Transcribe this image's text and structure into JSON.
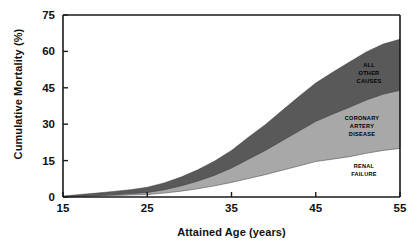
{
  "chart_data": {
    "type": "area",
    "title": "",
    "xlabel": "Attained Age (years)",
    "ylabel": "Cumulative Mortality (%)",
    "xlim": [
      15,
      55
    ],
    "ylim": [
      0,
      75
    ],
    "xticks": [
      "15",
      "25",
      "35",
      "45",
      "55"
    ],
    "xtick_values": [
      15,
      25,
      35,
      45,
      55
    ],
    "yticks": [
      "0",
      "15",
      "30",
      "45",
      "60",
      "75"
    ],
    "ytick_values": [
      0,
      15,
      30,
      45,
      60,
      75
    ],
    "grid": false,
    "legend_position": "inline-band-labels",
    "stacked": true,
    "x": [
      15,
      17,
      19,
      21,
      23,
      25,
      27,
      29,
      31,
      33,
      35,
      37,
      39,
      41,
      43,
      45,
      47,
      49,
      51,
      53,
      55
    ],
    "series": [
      {
        "name": "RENAL FAILURE",
        "color": "#ffffff",
        "order": 1,
        "values": [
          0.0,
          0.2,
          0.4,
          0.6,
          0.8,
          1.0,
          1.6,
          2.4,
          3.4,
          4.6,
          6.0,
          7.6,
          9.2,
          11.0,
          12.8,
          14.6,
          15.6,
          16.6,
          18.0,
          19.2,
          20.0
        ]
      },
      {
        "name": "CORONARY ARTERY DISEASE",
        "color": "#a8a8a8",
        "order": 2,
        "values": [
          0.0,
          0.1,
          0.2,
          0.4,
          0.6,
          0.9,
          1.4,
          2.2,
          3.2,
          4.4,
          6.0,
          8.0,
          10.0,
          12.2,
          14.4,
          16.6,
          18.6,
          20.4,
          22.0,
          23.2,
          24.0
        ]
      },
      {
        "name": "ALL OTHER CAUSES",
        "color": "#595959",
        "order": 3,
        "values": [
          0.4,
          0.7,
          1.0,
          1.3,
          1.6,
          2.1,
          2.8,
          3.6,
          4.6,
          5.8,
          7.2,
          9.0,
          10.6,
          12.4,
          14.2,
          15.8,
          17.2,
          18.6,
          19.8,
          20.6,
          21.0
        ]
      }
    ],
    "cumulative_totals": [
      0.4,
      1.0,
      1.6,
      2.3,
      3.0,
      4.0,
      5.8,
      8.2,
      11.2,
      14.8,
      19.2,
      24.6,
      29.8,
      35.6,
      41.4,
      47.0,
      51.4,
      55.6,
      59.8,
      63.0,
      65.0
    ],
    "band_labels": [
      {
        "name": "ALL OTHER CAUSES",
        "lines": [
          "ALL",
          "OTHER",
          "CAUSES"
        ]
      },
      {
        "name": "CORONARY ARTERY DISEASE",
        "lines": [
          "CORONARY",
          "ARTERY",
          "DISEASE"
        ]
      },
      {
        "name": "RENAL FAILURE",
        "lines": [
          "RENAL",
          "FAILURE"
        ]
      }
    ]
  }
}
